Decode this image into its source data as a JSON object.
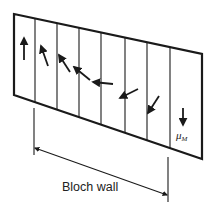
{
  "diagram": {
    "wall_label": "Bloch wall",
    "moment_label": "μ",
    "moment_subscript": "M",
    "colors": {
      "stroke": "#1a1a1a",
      "background": "#ffffff"
    },
    "panel": {
      "corners": [
        [
          14,
          14
        ],
        [
          202,
          54
        ],
        [
          202,
          159
        ],
        [
          14,
          95
        ]
      ],
      "dividers_x": [
        35,
        57,
        79,
        101,
        125,
        147,
        170
      ]
    },
    "moments": [
      {
        "from": [
          24,
          60
        ],
        "to": [
          24,
          38
        ],
        "direction": "up"
      },
      {
        "from": [
          48,
          66
        ],
        "to": [
          41,
          46
        ],
        "direction": "up-left"
      },
      {
        "from": [
          70,
          72
        ],
        "to": [
          59,
          55
        ],
        "direction": "up-left"
      },
      {
        "from": [
          90,
          80
        ],
        "to": [
          74,
          67
        ],
        "direction": "left-up"
      },
      {
        "from": [
          113,
          84
        ],
        "to": [
          93,
          82
        ],
        "direction": "left"
      },
      {
        "from": [
          138,
          89
        ],
        "to": [
          120,
          98
        ],
        "direction": "left-down"
      },
      {
        "from": [
          159,
          96
        ],
        "to": [
          148,
          113
        ],
        "direction": "down-left"
      },
      {
        "from": [
          183,
          108
        ],
        "to": [
          183,
          125
        ],
        "direction": "down"
      }
    ],
    "wall_extent": {
      "left_tick": {
        "x": 34,
        "y1": 108,
        "y2": 155
      },
      "right_tick": {
        "x": 168,
        "y1": 157,
        "y2": 202
      },
      "arrow_from": [
        35,
        148
      ],
      "arrow_to": [
        167,
        195
      ]
    }
  }
}
